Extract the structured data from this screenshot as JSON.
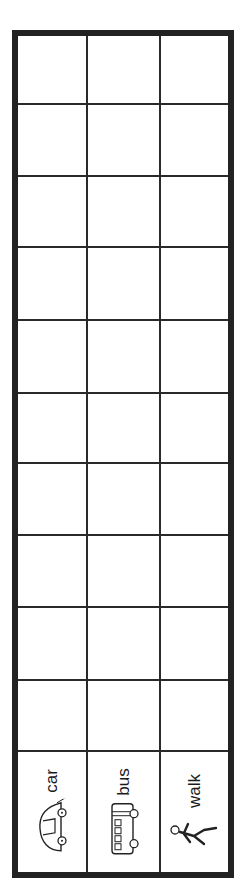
{
  "chart": {
    "rows": 11,
    "columns": 3,
    "border_color": "#222222"
  },
  "labels": [
    {
      "text": "car",
      "icon": "car-icon"
    },
    {
      "text": "bus",
      "icon": "bus-icon"
    },
    {
      "text": "walk",
      "icon": "walking-person-icon"
    }
  ]
}
